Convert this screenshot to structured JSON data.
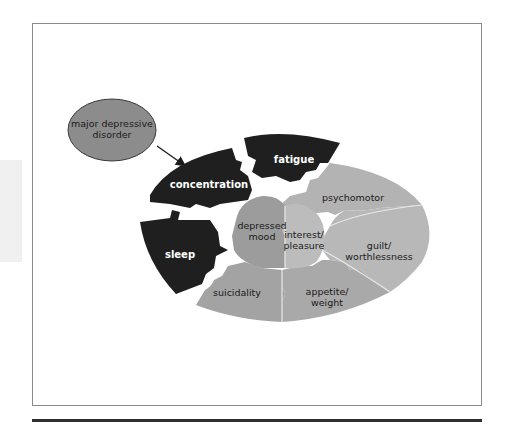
{
  "figure": {
    "title_node": {
      "line1": "major depressive",
      "line2": "disorder"
    },
    "pieces": {
      "concentration": "concentration",
      "fatigue": "fatigue",
      "sleep": "sleep",
      "psychomotor": "psychomotor",
      "guilt_line1": "guilt/",
      "guilt_line2": "worthlessness",
      "appetite_line1": "appetite/",
      "appetite_line2": "weight",
      "suicidality": "suicidality",
      "depressed_line1": "depressed",
      "depressed_line2": "mood",
      "interest_line1": "interest/",
      "interest_line2": "pleasure"
    },
    "colors": {
      "dark_piece": "#1f1f1f",
      "node_fill": "#8c8c8c",
      "psychomotor": "#b3b3b3",
      "guilt": "#b8b8b8",
      "appetite": "#a9a9a9",
      "suicidality": "#a3a3a3",
      "depressed": "#9c9c9c",
      "interest": "#bcbcbc",
      "frame": "#8a8a8a",
      "rule": "#2e2e2e"
    }
  }
}
